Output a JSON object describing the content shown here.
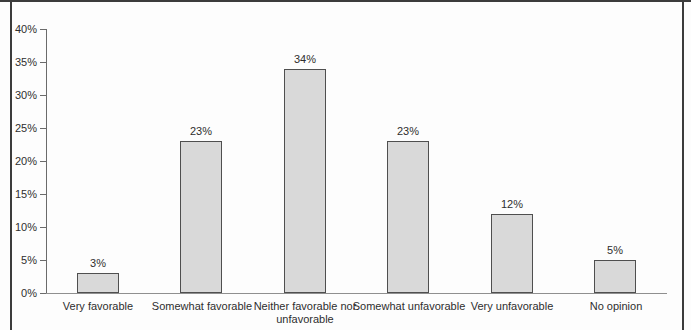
{
  "chart_data": {
    "type": "bar",
    "title": "",
    "xlabel": "",
    "ylabel": "",
    "categories": [
      "Very favorable",
      "Somewhat favorable",
      "Neither favorable nor unfavorable",
      "Somewhat unfavorable",
      "Very unfavorable",
      "No opinion"
    ],
    "values": [
      3,
      23,
      34,
      23,
      12,
      5
    ],
    "value_labels": [
      "3%",
      "23%",
      "34%",
      "23%",
      "12%",
      "5%"
    ],
    "y_ticks": [
      0,
      5,
      10,
      15,
      20,
      25,
      30,
      35,
      40
    ],
    "y_tick_labels": [
      "0%",
      "5%",
      "10%",
      "15%",
      "20%",
      "25%",
      "30%",
      "35%",
      "40%"
    ],
    "ylim": [
      0,
      40
    ],
    "grid": false,
    "legend": false
  },
  "colors": {
    "frame_border": "#3c3c3c",
    "axis": "#6b6b6b",
    "baseline": "#8f8f8f",
    "bar_fill": "#d9d9d9",
    "bar_border": "#4f4f4f",
    "text": "#2e2e2e",
    "background": "#fdfdfd"
  }
}
